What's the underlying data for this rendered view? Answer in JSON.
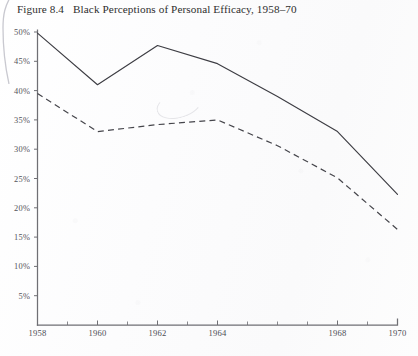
{
  "figure": {
    "number": "Figure 8.4",
    "title": "Black Perceptions of Personal Efficacy, 1958–70"
  },
  "chart_data": {
    "type": "line",
    "title": "Black Perceptions of Personal Efficacy, 1958–70",
    "xlabel": "",
    "ylabel": "",
    "x": [
      1958,
      1960,
      1962,
      1964,
      1966,
      1968,
      1970
    ],
    "xlim": [
      1958,
      1970
    ],
    "ylim": [
      0,
      50
    ],
    "grid": false,
    "legend": "none",
    "y_tick_values": [
      5,
      10,
      15,
      20,
      25,
      30,
      35,
      40,
      45,
      50
    ],
    "y_tick_labels": [
      "5%",
      "10%",
      "15%",
      "20%",
      "25%",
      "30%",
      "35%",
      "40%",
      "45%",
      "50%"
    ],
    "x_tick_values": [
      1958,
      1959,
      1960,
      1961,
      1962,
      1963,
      1964,
      1965,
      1966,
      1967,
      1968,
      1969,
      1970
    ],
    "x_tick_labels_shown": [
      "1958",
      "1960",
      "1962",
      "1964",
      "1968",
      "1970"
    ],
    "x_labeled_values": [
      1958,
      1960,
      1962,
      1964,
      1968,
      1970
    ],
    "series": [
      {
        "name": "solid-line",
        "style": "solid",
        "color": "#3d3d43",
        "values": [
          49.8,
          41.0,
          47.7,
          44.6,
          39.0,
          33.0,
          22.3
        ]
      },
      {
        "name": "dashed-line",
        "style": "dashed",
        "color": "#45454b",
        "values": [
          39.5,
          33.0,
          34.2,
          35.0,
          30.6,
          25.1,
          16.3
        ]
      }
    ]
  },
  "axes": {
    "y_axis_name": "percent-axis",
    "x_axis_name": "year-axis"
  }
}
